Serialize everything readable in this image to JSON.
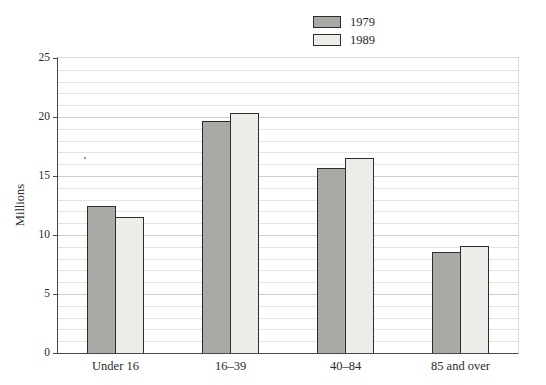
{
  "page": {
    "background": "#ffffff"
  },
  "chart_data": {
    "type": "bar",
    "title": "",
    "xlabel": "",
    "ylabel": "Millions",
    "ylim": [
      0,
      25
    ],
    "ytick_major": 5,
    "ytick_minor": 1,
    "grid": "horizontal, minor lines every 1 unit, light gray",
    "legend_position": "top-right",
    "categories": [
      "Under 16",
      "16–39",
      "40–84",
      "85 and over"
    ],
    "series": [
      {
        "name": "1979",
        "color": "#a9a9a5",
        "values": [
          12.5,
          19.7,
          15.7,
          8.6
        ]
      },
      {
        "name": "1989",
        "color": "#ecece8",
        "values": [
          11.5,
          20.3,
          16.5,
          9.1
        ]
      }
    ],
    "bar_outline_color": "#2d2d2d",
    "axis_color": "#4a4a4a"
  }
}
